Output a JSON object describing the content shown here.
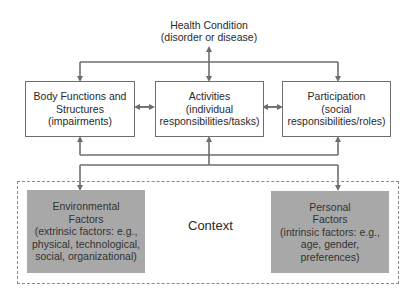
{
  "diagram": {
    "health_condition": {
      "title": "Health Condition",
      "subtitle": "(disorder or disease)"
    },
    "components": [
      {
        "id": "body",
        "lines": [
          "Body Functions and",
          "Structures",
          "(impairments)"
        ]
      },
      {
        "id": "activities",
        "lines": [
          "Activities",
          "(individual",
          "responsibilities/tasks)"
        ]
      },
      {
        "id": "participation",
        "lines": [
          "Participation",
          "(social",
          "responsibilities/roles)"
        ]
      }
    ],
    "context": {
      "label": "Context",
      "environmental": {
        "lines": [
          "Environmental",
          "Factors",
          "(extrinsic factors: e.g.,",
          "physical, technological,",
          "social, organizational)"
        ]
      },
      "personal": {
        "lines": [
          "Personal",
          "Factors",
          "(intrinsic factors: e.g.,",
          "age, gender,",
          "preferences)"
        ]
      }
    },
    "colors": {
      "line": "#6e6e6e",
      "factor_box": "#a8a8a8",
      "dashed_border": "#8a8a8a"
    }
  }
}
